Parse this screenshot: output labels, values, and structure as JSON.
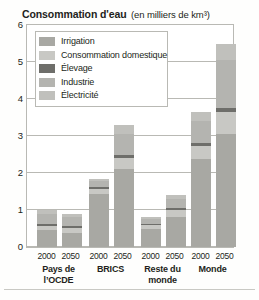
{
  "chart_data": {
    "type": "bar",
    "stacked": true,
    "title": "Consommation d'eau",
    "subtitle": "(en milliers de km³)",
    "xlabel": "",
    "ylabel": "",
    "ylim": [
      0,
      6
    ],
    "yticks": [
      0,
      1,
      2,
      3,
      4,
      5,
      6
    ],
    "ytick_labels": [
      "0",
      "1",
      "2",
      "3",
      "4",
      "5",
      "6"
    ],
    "grid": true,
    "legend_position": "top-left",
    "categories": [
      "Pays de l’OCDE 2000",
      "Pays de l’OCDE 2050",
      "BRICS 2000",
      "BRICS 2050",
      "Reste du monde 2000",
      "Reste du monde 2050",
      "Monde 2000",
      "Monde 2050"
    ],
    "groups": [
      {
        "name": "Pays de",
        "name2": "l’OCDE",
        "years": [
          "2000",
          "2050"
        ]
      },
      {
        "name": "BRICS",
        "name2": "",
        "years": [
          "2000",
          "2050"
        ]
      },
      {
        "name": "Reste du",
        "name2": "monde",
        "years": [
          "2000",
          "2050"
        ]
      },
      {
        "name": "Monde",
        "name2": "",
        "years": [
          "2000",
          "2050"
        ]
      }
    ],
    "series": [
      {
        "name": "Irrigation",
        "color": "#a8a8a3",
        "values": [
          0.45,
          0.38,
          1.42,
          2.1,
          0.5,
          0.82,
          2.37,
          3.05
        ]
      },
      {
        "name": "Consommation domestique",
        "color": "#c8c8c4",
        "values": [
          0.12,
          0.13,
          0.14,
          0.3,
          0.09,
          0.18,
          0.35,
          0.6
        ]
      },
      {
        "name": "Élevage",
        "color": "#6e6e6a",
        "values": [
          0.05,
          0.05,
          0.05,
          0.08,
          0.03,
          0.05,
          0.08,
          0.12
        ]
      },
      {
        "name": "Industrie",
        "color": "#b4b4b0",
        "values": [
          0.28,
          0.24,
          0.18,
          0.58,
          0.13,
          0.25,
          0.6,
          1.28
        ]
      },
      {
        "name": "Électricité",
        "color": "#c0c0bc",
        "values": [
          0.1,
          0.1,
          0.06,
          0.24,
          0.05,
          0.1,
          0.25,
          0.45
        ]
      }
    ],
    "totals": [
      1.0,
      0.9,
      1.85,
      3.3,
      0.8,
      1.4,
      3.65,
      5.5
    ]
  },
  "legend": {
    "items": [
      {
        "label": "Irrigation",
        "color": "#a8a8a3"
      },
      {
        "label": "Consommation domestique",
        "color": "#c8c8c4"
      },
      {
        "label": "Élevage",
        "color": "#6e6e6a"
      },
      {
        "label": "Industrie",
        "color": "#b4b4b0"
      },
      {
        "label": "Électricité",
        "color": "#c0c0bc"
      }
    ]
  }
}
